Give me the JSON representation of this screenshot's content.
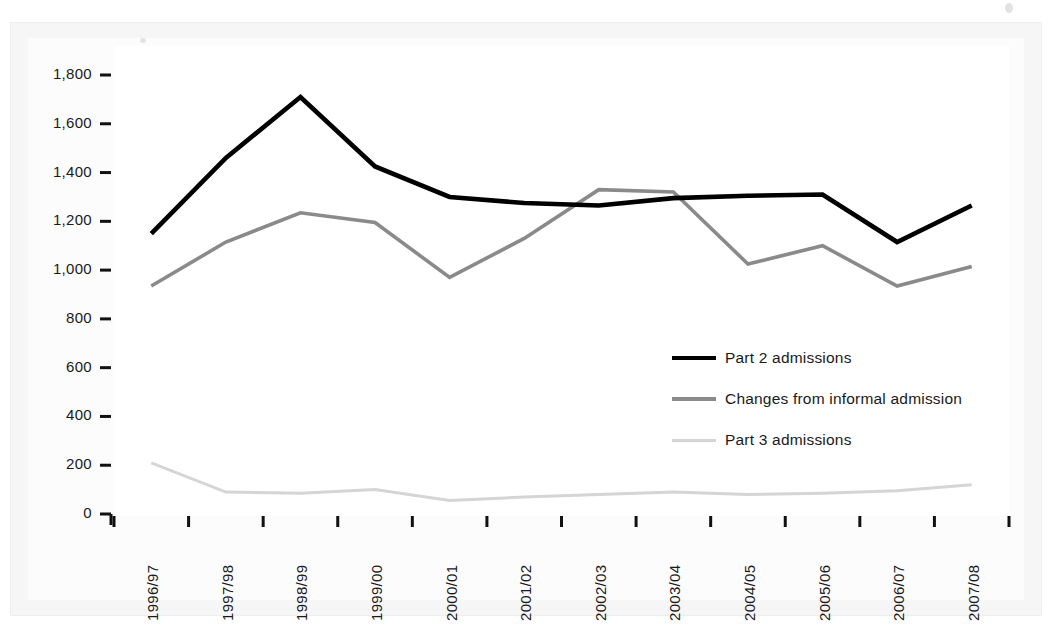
{
  "figure": {
    "background_color": "#ffffff",
    "frame_color": "#f6f6f6",
    "plot_background": "#ffffff"
  },
  "axes": {
    "y_ticks": [
      "0",
      "200",
      "400",
      "600",
      "800",
      "1,000",
      "1,200",
      "1,400",
      "1,600",
      "1,800"
    ],
    "x_ticks": [
      "1996/97",
      "1997/98",
      "1998/99",
      "1999/00",
      "2000/01",
      "2001/02",
      "2002/03",
      "2003/04",
      "2004/05",
      "2005/06",
      "2006/07",
      "2007/08"
    ]
  },
  "legend": {
    "position": "center-right",
    "entries": [
      {
        "label": "Part 2 admissions",
        "color": "#000000",
        "width": 4.5
      },
      {
        "label": "Changes from informal admission",
        "color": "#8a8a8a",
        "width": 3.5
      },
      {
        "label": "Part 3 admissions",
        "color": "#d5d5d5",
        "width": 3.0
      }
    ]
  },
  "chart_data": {
    "type": "line",
    "title": "",
    "subtitle": "",
    "xlabel": "",
    "ylabel": "",
    "ylim": [
      0,
      1800
    ],
    "ytick_step": 200,
    "grid": false,
    "legend_position": "center-right",
    "categories": [
      "1996/97",
      "1997/98",
      "1998/99",
      "1999/00",
      "2000/01",
      "2001/02",
      "2002/03",
      "2003/04",
      "2004/05",
      "2005/06",
      "2006/07",
      "2007/08"
    ],
    "series": [
      {
        "name": "Part 2 admissions",
        "color": "#000000",
        "values": [
          1150,
          1460,
          1710,
          1425,
          1300,
          1275,
          1265,
          1295,
          1305,
          1310,
          1115,
          1265
        ]
      },
      {
        "name": "Changes from informal admission",
        "color": "#8a8a8a",
        "values": [
          935,
          1115,
          1235,
          1195,
          970,
          1130,
          1330,
          1320,
          1025,
          1100,
          935,
          1015
        ]
      },
      {
        "name": "Part 3 admissions",
        "color": "#d5d5d5",
        "values": [
          210,
          90,
          85,
          100,
          55,
          70,
          80,
          90,
          80,
          85,
          95,
          120
        ]
      }
    ]
  }
}
